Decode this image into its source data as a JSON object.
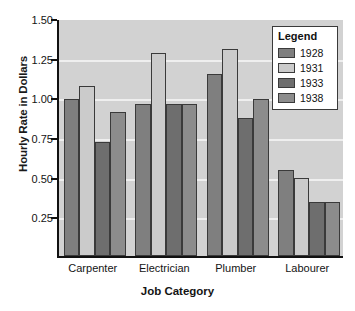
{
  "chart_data": {
    "type": "bar",
    "title": "",
    "xlabel": "Job Category",
    "ylabel": "Hourly Rate in Dollars",
    "categories": [
      "Carpenter",
      "Electrician",
      "Plumber",
      "Labourer"
    ],
    "series": [
      {
        "name": "1928",
        "color": "#7f7f7f",
        "values": [
          0.99,
          0.955,
          1.15,
          0.54
        ]
      },
      {
        "name": "1931",
        "color": "#cbcbcb",
        "values": [
          1.07,
          1.28,
          1.305,
          0.49
        ]
      },
      {
        "name": "1933",
        "color": "#6e6e6e",
        "values": [
          0.72,
          0.955,
          0.87,
          0.34
        ]
      },
      {
        "name": "1938",
        "color": "#8c8c8c",
        "values": [
          0.905,
          0.955,
          0.99,
          0.34
        ]
      }
    ],
    "ylim": [
      0,
      1.5
    ],
    "yticks": [
      "1.50",
      "1.25",
      "1.00",
      "0.75",
      "0.50",
      "0.25"
    ],
    "ytick_values": [
      1.5,
      1.25,
      1.0,
      0.75,
      0.5,
      0.25
    ],
    "grid": true,
    "legend_position": "top-right",
    "plot_background": "#d2d2d2",
    "gridline_color": "#efefef"
  },
  "legend": {
    "title": "Legend",
    "entries": [
      {
        "label": "1928",
        "color": "#7f7f7f"
      },
      {
        "label": "1931",
        "color": "#cbcbcb"
      },
      {
        "label": "1933",
        "color": "#6e6e6e"
      },
      {
        "label": "1938",
        "color": "#8c8c8c"
      }
    ]
  }
}
